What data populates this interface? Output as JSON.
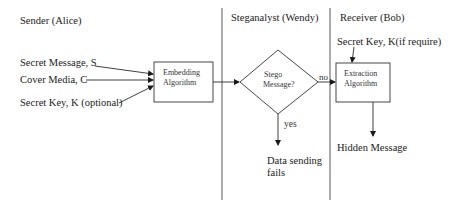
{
  "lanes": {
    "sender": "Sender (Alice)",
    "steganalyst": "Steganalyst (Wendy)",
    "receiver": "Receiver (Bob)"
  },
  "sender_inputs": {
    "secret_message": "Secret Message, S",
    "cover_media": "Cover Media, C",
    "secret_key": "Secret Key, K (optional)"
  },
  "embedding_box": {
    "line1": "Embedding",
    "line2": "Algorithm"
  },
  "decision": {
    "line1": "Stego",
    "line2": "Message?",
    "no_label": "no",
    "yes_label": "yes"
  },
  "fail_outcome": {
    "line1": "Data sending",
    "line2": "fails"
  },
  "receiver_key": "Secret Key, K(if require)",
  "extraction_box": {
    "line1": "Extraction",
    "line2": "Algorithm"
  },
  "output": "Hidden Message",
  "colors": {
    "line": "#2a2a2a",
    "background": "#ffffff"
  }
}
